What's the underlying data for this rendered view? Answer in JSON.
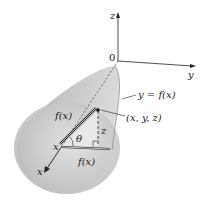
{
  "diagram": {
    "axes": {
      "z_label": "z",
      "y_label": "y",
      "x_label": "x",
      "origin_label": "0"
    },
    "labels": {
      "curve": "y = f(x)",
      "point": "(x, y, z)",
      "slant": "f(x)",
      "base": "f(x)",
      "height": "z",
      "angle": "θ",
      "x_pos": "x"
    },
    "colors": {
      "surface_light": "#d9d9d9",
      "surface_mid": "#b5b5b5",
      "surface_dark": "#8f8f8f",
      "line": "#222222"
    }
  }
}
